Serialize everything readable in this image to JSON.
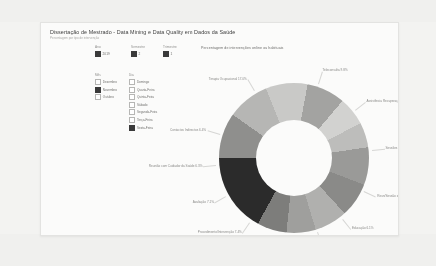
{
  "report": {
    "title": "Dissertação de Mestrado - Data Mining e Data Quality em Dados da Saúde",
    "subtitle": "Percentagem por tipo de intervenção"
  },
  "slicers": [
    {
      "name": "ano",
      "title": "Ano",
      "value": "2019",
      "checked": true
    },
    {
      "name": "mes",
      "title": "Semestre",
      "value": "2",
      "checked": true
    },
    {
      "name": "dia",
      "title": "Trimestre",
      "value": "1",
      "checked": true
    }
  ],
  "legend": {
    "left": {
      "head": "Mês",
      "items": [
        {
          "label": "Dezembro",
          "checked": false
        },
        {
          "label": "Novembro",
          "checked": true
        },
        {
          "label": "Outubro",
          "checked": false
        }
      ]
    },
    "right": {
      "head": "Dia",
      "items": [
        {
          "label": "Domingo",
          "checked": false
        },
        {
          "label": "Quarta-Feira",
          "checked": false
        },
        {
          "label": "Quinta-Feira",
          "checked": false
        },
        {
          "label": "Sábado",
          "checked": false
        },
        {
          "label": "Segunda-Feira",
          "checked": false
        },
        {
          "label": "Terça-Feira",
          "checked": false
        },
        {
          "label": "Sexta-Feira",
          "checked": true
        }
      ]
    }
  },
  "kpi": {
    "value": "42",
    "label": "Número de intervenções online"
  },
  "chart_data": {
    "type": "pie",
    "variant": "donut",
    "title": "Percentagem de intervenções online ou habituais",
    "legend_position": "labels-outside",
    "grid": false,
    "unit": "%",
    "categories": [
      "Teleconsulta",
      "Assistência Recuperação",
      "Sessões de Grupo",
      "Reunião/Sessão de Estudo em Serviço",
      "Educação",
      "Guia de Intervenção",
      "Dom/Ida ao domicílio",
      "Procedimento/Intervenção",
      "Avaliação",
      "Reunião com Cuidador da Saúde",
      "Contactos Indirectos",
      "Terapia Ocupacional"
    ],
    "values": [
      9.8,
      9.1,
      9.0,
      8.3,
      6.1,
      5.4,
      8.1,
      7.4,
      7.1,
      6.3,
      6.4,
      17.0
    ],
    "labels": [
      "Teleconsulta 9.8%",
      "Assistência Recuperação 9.1%",
      "Sessões de Grupo 9.0%",
      "Reun/Sessão de Estudo em Serviço 8.3%",
      "Educação 6.1%",
      "Guia de Intervenção 5.4%",
      "Dom/Ida ao domicílio 8.1%",
      "Procedimento/Intervenção 7.4%",
      "Avaliação 7.1%",
      "Reunião com Cuidador da Saúde 6.3%",
      "Contactos Indirectos 6.4%",
      "Terapia Ocupacional 17.0%"
    ],
    "colors": [
      "#8f8f8d",
      "#b6b6b4",
      "#c9c9c7",
      "#a3a3a1",
      "#d2d2d0",
      "#bdbdbb",
      "#9a9a98",
      "#8a8a88",
      "#b0b0ae",
      "#9f9f9d",
      "#7d7d7b",
      "#2b2b2b"
    ]
  }
}
